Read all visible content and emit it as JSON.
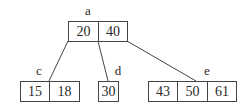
{
  "diagram": {
    "type": "b-tree",
    "nodes": {
      "a": {
        "label": "a",
        "keys": [
          "20",
          "40"
        ]
      },
      "c": {
        "label": "c",
        "keys": [
          "15",
          "18"
        ]
      },
      "d": {
        "label": "d",
        "keys": [
          "30"
        ]
      },
      "e": {
        "label": "e",
        "keys": [
          "43",
          "50",
          "61"
        ]
      }
    },
    "edges": [
      {
        "from": "a",
        "to": "c"
      },
      {
        "from": "a",
        "to": "d"
      },
      {
        "from": "a",
        "to": "e"
      }
    ]
  }
}
